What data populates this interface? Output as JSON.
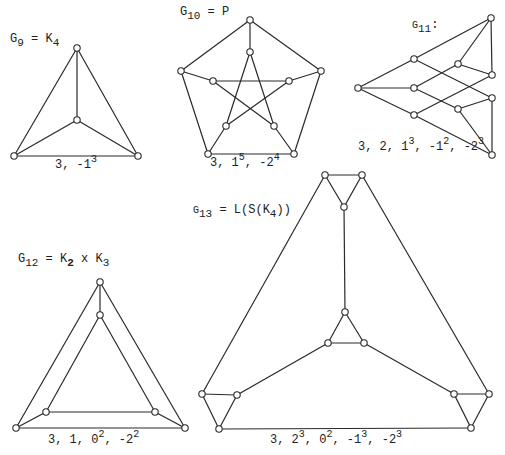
{
  "graphs": [
    {
      "id": "g9",
      "name": "G",
      "index": "9",
      "title_eq": " = K",
      "title_sub2": "4",
      "title_rest": "",
      "title_pos": [
        10,
        38
      ],
      "spectrum": [
        {
          "base": "3, -1",
          "exp": "3"
        }
      ],
      "spectrum_pos": [
        55,
        160
      ],
      "vertices": [
        [
          77,
          48
        ],
        [
          77,
          120
        ],
        [
          14,
          156
        ],
        [
          138,
          156
        ]
      ],
      "edges": [
        [
          0,
          1
        ],
        [
          0,
          2
        ],
        [
          0,
          3
        ],
        [
          1,
          2
        ],
        [
          1,
          3
        ],
        [
          2,
          3
        ]
      ]
    },
    {
      "id": "g10",
      "name": "G",
      "index": "10",
      "title_eq": " = P",
      "title_sub2": "",
      "title_rest": "",
      "title_pos": [
        180,
        10
      ],
      "spectrum": [
        {
          "base": "3, 1",
          "exp": "5"
        },
        {
          "base": ", -2",
          "exp": "4"
        }
      ],
      "spectrum_pos": [
        209,
        156
      ],
      "vertices": [
        [
          250,
          20
        ],
        [
          321,
          71
        ],
        [
          294,
          154
        ],
        [
          208,
          154
        ],
        [
          181,
          71
        ],
        [
          250,
          52
        ],
        [
          289,
          81
        ],
        [
          274,
          126
        ],
        [
          226,
          126
        ],
        [
          213,
          81
        ]
      ],
      "edges": [
        [
          0,
          1
        ],
        [
          1,
          2
        ],
        [
          2,
          3
        ],
        [
          3,
          4
        ],
        [
          4,
          0
        ],
        [
          0,
          5
        ],
        [
          1,
          6
        ],
        [
          2,
          7
        ],
        [
          3,
          8
        ],
        [
          4,
          9
        ],
        [
          5,
          7
        ],
        [
          7,
          9
        ],
        [
          9,
          6
        ],
        [
          6,
          8
        ],
        [
          8,
          5
        ]
      ]
    },
    {
      "id": "g11",
      "name": "G",
      "index": "11",
      "title_eq": ":",
      "title_sub2": "",
      "title_rest": "",
      "title_pos": [
        413,
        22
      ],
      "spectrum": [
        {
          "base": "3, 2, 1",
          "exp": "3"
        },
        {
          "base": ", -1",
          "exp": "2"
        },
        {
          "base": ", -2",
          "exp": "3"
        }
      ],
      "spectrum_pos": [
        358,
        140
      ],
      "vertices": [
        [
          358,
          88
        ],
        [
          414,
          59
        ],
        [
          414,
          88
        ],
        [
          414,
          115
        ],
        [
          458,
          64
        ],
        [
          458,
          109
        ],
        [
          491,
          18
        ],
        [
          492,
          75
        ],
        [
          492,
          98
        ],
        [
          492,
          155
        ]
      ],
      "edges": [
        [
          0,
          1
        ],
        [
          0,
          2
        ],
        [
          0,
          3
        ],
        [
          1,
          6
        ],
        [
          1,
          8
        ],
        [
          2,
          4
        ],
        [
          2,
          5
        ],
        [
          3,
          7
        ],
        [
          3,
          9
        ],
        [
          4,
          6
        ],
        [
          4,
          7
        ],
        [
          5,
          8
        ],
        [
          5,
          9
        ],
        [
          6,
          7
        ],
        [
          8,
          9
        ]
      ]
    },
    {
      "id": "g12",
      "name": "G",
      "index": "12",
      "title_eq": " = K",
      "title_sub2": "2",
      "title_rest": " x K",
      "title_sub3": "3",
      "title_pos": [
        18,
        257
      ],
      "spectrum": [
        {
          "base": "3, 1, 0",
          "exp": "2"
        },
        {
          "base": ", -2",
          "exp": "2"
        }
      ],
      "spectrum_pos": [
        48,
        432
      ],
      "vertices": [
        [
          100,
          282
        ],
        [
          100,
          315
        ],
        [
          46,
          412
        ],
        [
          155,
          412
        ],
        [
          16,
          428
        ],
        [
          185,
          428
        ]
      ],
      "edges": [
        [
          0,
          4
        ],
        [
          0,
          5
        ],
        [
          4,
          5
        ],
        [
          1,
          2
        ],
        [
          1,
          3
        ],
        [
          2,
          3
        ],
        [
          0,
          1
        ],
        [
          2,
          4
        ],
        [
          3,
          5
        ]
      ]
    },
    {
      "id": "g13",
      "name": "G",
      "index": "13",
      "title_eq": " = L(S(K",
      "title_sub2": "4",
      "title_rest": "))",
      "title_pos": [
        195,
        207
      ],
      "spectrum": [
        {
          "base": "3, 2",
          "exp": "3"
        },
        {
          "base": ", 0",
          "exp": "2"
        },
        {
          "base": ", -1",
          "exp": "3"
        },
        {
          "base": ", -2",
          "exp": "3"
        }
      ],
      "spectrum_pos": [
        268,
        432
      ],
      "vertices": [
        [
          325,
          175
        ],
        [
          362,
          175
        ],
        [
          344,
          207
        ],
        [
          345,
          312
        ],
        [
          328,
          343
        ],
        [
          364,
          343
        ],
        [
          202,
          394
        ],
        [
          237,
          395
        ],
        [
          219,
          429
        ],
        [
          454,
          394
        ],
        [
          489,
          394
        ],
        [
          471,
          428
        ]
      ],
      "edges": [
        [
          0,
          1
        ],
        [
          0,
          2
        ],
        [
          1,
          2
        ],
        [
          3,
          4
        ],
        [
          3,
          5
        ],
        [
          4,
          5
        ],
        [
          6,
          7
        ],
        [
          6,
          8
        ],
        [
          7,
          8
        ],
        [
          9,
          10
        ],
        [
          9,
          11
        ],
        [
          10,
          11
        ],
        [
          2,
          3
        ],
        [
          4,
          7
        ],
        [
          5,
          9
        ],
        [
          8,
          11
        ],
        [
          0,
          6
        ],
        [
          1,
          10
        ]
      ]
    }
  ],
  "style": {
    "line_color": "#2a2a2a",
    "vertex_fill": "#ffffff",
    "background": "#ffffff"
  }
}
